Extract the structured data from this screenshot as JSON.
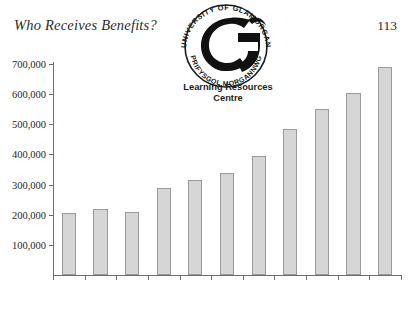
{
  "page": {
    "running_head": "Who Receives Benefits?",
    "folio": "113"
  },
  "stamp": {
    "name": "university-library-stamp",
    "ring_text_top": "UNIVERSITY OF GLAMORGAN",
    "ring_text_bottom": "PRIFYSGOL MORGANNWG",
    "caption_line1": "Learning Resources",
    "caption_line2": "Centre"
  },
  "colors": {
    "bar_fill": "#d6d6d6",
    "bar_stroke": "#9a9a9a",
    "axis": "#6e6e6e",
    "text": "#262626"
  },
  "chart_data": {
    "type": "bar",
    "title": "",
    "xlabel": "",
    "ylabel": "",
    "categories": [
      "1986",
      "87",
      "88",
      "89",
      "90",
      "91",
      "92",
      "93",
      "94",
      "95",
      "96"
    ],
    "values": [
      205000,
      220000,
      210000,
      290000,
      315000,
      340000,
      395000,
      485000,
      550000,
      605000,
      690000
    ],
    "ylim": [
      0,
      700000
    ],
    "ytick_values": [
      100000,
      200000,
      300000,
      400000,
      500000,
      600000,
      700000
    ],
    "ytick_labels": [
      "100,000",
      "200,000",
      "300,000",
      "400,000",
      "500,000",
      "600,000",
      "700,000"
    ],
    "grid": false,
    "legend": false
  }
}
